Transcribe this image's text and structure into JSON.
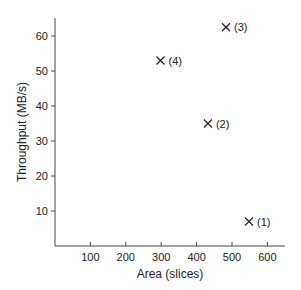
{
  "chart_data": {
    "type": "scatter",
    "title": "",
    "xlabel": "Area (slices)",
    "ylabel": "Throughput (MB/s)",
    "xlim": [
      0,
      650
    ],
    "ylim": [
      0,
      65
    ],
    "xticks": [
      100,
      200,
      300,
      400,
      500,
      600
    ],
    "yticks": [
      10,
      20,
      30,
      40,
      50,
      60
    ],
    "grid": false,
    "legend": null,
    "marker": "x",
    "points": [
      {
        "label": "(1)",
        "x": 548,
        "y": 7
      },
      {
        "label": "(2)",
        "x": 432,
        "y": 35
      },
      {
        "label": "(3)",
        "x": 483,
        "y": 62.5
      },
      {
        "label": "(4)",
        "x": 298,
        "y": 53
      }
    ]
  },
  "colors": {
    "axis": "#444444",
    "marker": "#222222",
    "text": "#222222"
  }
}
